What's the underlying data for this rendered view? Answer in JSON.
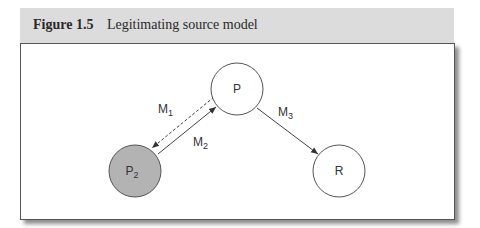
{
  "caption": {
    "number": "Figure 1.5",
    "title": "Legitimating source model"
  },
  "nodes": [
    {
      "id": "P",
      "label": "P",
      "sub": "",
      "fill": "#ffffff"
    },
    {
      "id": "P2",
      "label": "P",
      "sub": "2",
      "fill": "#b3b3b3"
    },
    {
      "id": "R",
      "label": "R",
      "sub": "",
      "fill": "#ffffff"
    }
  ],
  "edges": [
    {
      "id": "M1",
      "label": "M",
      "sub": "1",
      "from": "P",
      "to": "P2",
      "style": "dashed"
    },
    {
      "id": "M2",
      "label": "M",
      "sub": "2",
      "from": "P2",
      "to": "P",
      "style": "solid"
    },
    {
      "id": "M3",
      "label": "M",
      "sub": "3",
      "from": "P",
      "to": "R",
      "style": "solid"
    }
  ],
  "colors": {
    "header_bg": "#dcdcdc",
    "shaded_node": "#b3b3b3",
    "stroke": "#444444"
  }
}
